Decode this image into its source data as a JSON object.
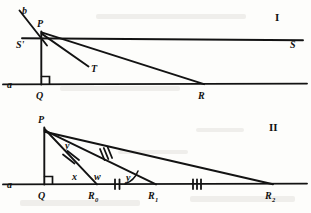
{
  "document": {
    "kind": "geometry-figure-plate",
    "background_color": "#fdfdfb",
    "ink_color": "#131313",
    "figure_count": 2
  },
  "figure_one": {
    "numeral": "I",
    "numeral_position": {
      "x": 277,
      "y": 17
    },
    "baseline_label": "a",
    "baseline_label_position": {
      "x": 8,
      "y": 88
    },
    "upper_line_left_label": "S'",
    "upper_line_left_label_position": {
      "x": 17,
      "y": 47
    },
    "upper_line_right_label": "S",
    "upper_line_right_label_position": {
      "x": 292,
      "y": 44
    },
    "transversal_label": "b",
    "transversal_label_position": {
      "x": 22,
      "y": 14
    },
    "ray_label": "T",
    "ray_label_position": {
      "x": 92,
      "y": 70
    },
    "points": [
      {
        "name": "P",
        "x": 41,
        "y": 31,
        "label": "P",
        "label_x": 37,
        "label_y": 26
      },
      {
        "name": "Q",
        "x": 41,
        "y": 84,
        "label": "Q",
        "label_x": 36,
        "label_y": 98
      },
      {
        "name": "R",
        "x": 203,
        "y": 84,
        "label": "R",
        "label_x": 199,
        "label_y": 98
      }
    ],
    "right_angle_at": "Q",
    "segments": [
      {
        "name": "line-a",
        "from": [
          3,
          84
        ],
        "to": [
          307,
          84
        ]
      },
      {
        "name": "line-S-prime-S",
        "from": [
          22,
          38
        ],
        "to": [
          303,
          40
        ]
      },
      {
        "name": "transversal-b",
        "from": [
          19,
          10
        ],
        "to": [
          47,
          45
        ]
      },
      {
        "name": "segment-PQ",
        "from": [
          41,
          31
        ],
        "to": [
          41,
          84
        ]
      },
      {
        "name": "segment-PR",
        "from": [
          41,
          32
        ],
        "to": [
          204,
          84
        ]
      },
      {
        "name": "ray-PT",
        "from": [
          41,
          33
        ],
        "to": [
          88,
          66
        ]
      }
    ]
  },
  "figure_two": {
    "numeral": "II",
    "numeral_position": {
      "x": 272,
      "y": 127
    },
    "baseline_label": "a",
    "baseline_label_position": {
      "x": 8,
      "y": 186
    },
    "points": [
      {
        "name": "P",
        "x": 44,
        "y": 127,
        "label": "P",
        "label_x": 39,
        "label_y": 122
      },
      {
        "name": "Q",
        "x": 44,
        "y": 184,
        "label": "Q",
        "label_x": 39,
        "label_y": 198
      },
      {
        "name": "R0",
        "x": 96,
        "y": 184,
        "label": "R",
        "sub": "0",
        "label_x": 89,
        "label_y": 198
      },
      {
        "name": "R1",
        "x": 155,
        "y": 184,
        "label": "R",
        "sub": "1",
        "label_x": 149,
        "label_y": 198
      },
      {
        "name": "R2",
        "x": 272,
        "y": 184,
        "label": "R",
        "sub": "2",
        "label_x": 266,
        "label_y": 198
      }
    ],
    "right_angle_at": "Q",
    "segments": [
      {
        "name": "line-a",
        "from": [
          3,
          184
        ],
        "to": [
          307,
          184
        ]
      },
      {
        "name": "segment-PQ",
        "from": [
          44,
          127
        ],
        "to": [
          44,
          184
        ]
      },
      {
        "name": "segment-PR0",
        "from": [
          44,
          129
        ],
        "to": [
          97,
          184
        ]
      },
      {
        "name": "segment-PR1",
        "from": [
          44,
          130
        ],
        "to": [
          156,
          184
        ]
      },
      {
        "name": "segment-PR2",
        "from": [
          44,
          131
        ],
        "to": [
          273,
          184
        ]
      }
    ],
    "angle_labels": [
      {
        "name": "angle-y-at-P",
        "text": "y",
        "x": 68,
        "y": 146
      },
      {
        "name": "angle-x-at-R0",
        "text": "x",
        "x": 75,
        "y": 177
      },
      {
        "name": "angle-w-at-R0",
        "text": "w",
        "x": 98,
        "y": 177
      },
      {
        "name": "angle-y-at-R1",
        "text": "y",
        "x": 129,
        "y": 178
      }
    ],
    "tick_marks": [
      {
        "name": "tick-double-on-PR0",
        "count": 2,
        "x": 70,
        "y": 158,
        "rotation": -48
      },
      {
        "name": "tick-triple-on-PR1",
        "count": 3,
        "x": 104,
        "y": 154,
        "rotation": -63
      },
      {
        "name": "tick-double-on-baseline-R0R1",
        "count": 2,
        "x": 117,
        "y": 184,
        "rotation": 0
      },
      {
        "name": "tick-triple-on-baseline-R1R2",
        "count": 3,
        "x": 196,
        "y": 184,
        "rotation": 0
      }
    ]
  }
}
